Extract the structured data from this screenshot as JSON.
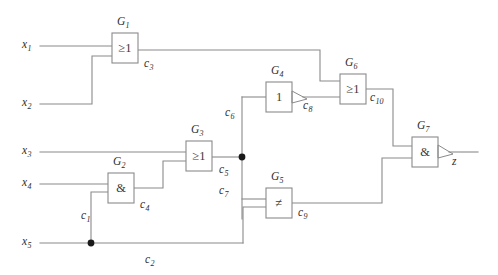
{
  "diagram": {
    "type": "combinational-logic-gate-network",
    "style": "IEC rectangular gate symbols",
    "output_signal": "z"
  },
  "inputs": [
    {
      "id": "x1",
      "label": "x",
      "index": "1"
    },
    {
      "id": "x2",
      "label": "x",
      "index": "2"
    },
    {
      "id": "x3",
      "label": "x",
      "index": "3"
    },
    {
      "id": "x4",
      "label": "x",
      "index": "4"
    },
    {
      "id": "x5",
      "label": "x",
      "index": "5"
    }
  ],
  "output": {
    "id": "z",
    "label": "z"
  },
  "gates": [
    {
      "id": "G1",
      "name": "G",
      "index": "1",
      "symbol": "≥1",
      "kind": "or",
      "inverted": false
    },
    {
      "id": "G2",
      "name": "G",
      "index": "2",
      "symbol": "&",
      "kind": "and",
      "inverted": false
    },
    {
      "id": "G3",
      "name": "G",
      "index": "3",
      "symbol": "≥1",
      "kind": "or",
      "inverted": false
    },
    {
      "id": "G4",
      "name": "G",
      "index": "4",
      "symbol": "1",
      "kind": "buffer",
      "inverted": true
    },
    {
      "id": "G5",
      "name": "G",
      "index": "5",
      "symbol": "≠",
      "kind": "xor",
      "inverted": false
    },
    {
      "id": "G6",
      "name": "G",
      "index": "6",
      "symbol": "≥1",
      "kind": "or",
      "inverted": false
    },
    {
      "id": "G7",
      "name": "G",
      "index": "7",
      "symbol": "&",
      "kind": "and",
      "inverted": true
    }
  ],
  "nets": [
    {
      "id": "c1",
      "label": "c",
      "index": "1"
    },
    {
      "id": "c2",
      "label": "c",
      "index": "2"
    },
    {
      "id": "c3",
      "label": "c",
      "index": "3"
    },
    {
      "id": "c4",
      "label": "c",
      "index": "4"
    },
    {
      "id": "c5",
      "label": "c",
      "index": "5"
    },
    {
      "id": "c6",
      "label": "c",
      "index": "6"
    },
    {
      "id": "c7",
      "label": "c",
      "index": "7"
    },
    {
      "id": "c8",
      "label": "c",
      "index": "8"
    },
    {
      "id": "c9",
      "label": "c",
      "index": "9"
    },
    {
      "id": "c10",
      "label": "c",
      "index": "10"
    }
  ],
  "connections": [
    {
      "from": "x1",
      "to": "G1.in1",
      "net": ""
    },
    {
      "from": "x2",
      "to": "G1.in2",
      "net": ""
    },
    {
      "from": "G1.out",
      "to": "G6.in1",
      "net": "c3"
    },
    {
      "from": "x5",
      "to": "G2.in2",
      "net": "c1"
    },
    {
      "from": "x4",
      "to": "G2.in1",
      "net": ""
    },
    {
      "from": "G2.out",
      "to": "G3.in2",
      "net": "c4"
    },
    {
      "from": "x3",
      "to": "G3.in1",
      "net": ""
    },
    {
      "from": "G3.out",
      "to": "junction",
      "net": "c5"
    },
    {
      "from": "junction",
      "to": "G4.in1",
      "net": "c6"
    },
    {
      "from": "junction",
      "to": "G5.in1",
      "net": "c7"
    },
    {
      "from": "G4.out",
      "to": "G6.in2",
      "net": "c8"
    },
    {
      "from": "x5",
      "to": "G5.in2",
      "net": "c2"
    },
    {
      "from": "G5.out",
      "to": "G7.in2",
      "net": "c9"
    },
    {
      "from": "G6.out",
      "to": "G7.in1",
      "net": "c10"
    },
    {
      "from": "G7.out",
      "to": "z",
      "net": ""
    }
  ],
  "colors": {
    "wire": "#8a8a8a",
    "gate_outline": "#8a8a8a",
    "gate_fill": "#ffffff",
    "text": "#2e2e2e",
    "junction_dot": "#1a1a1a",
    "background": "#ffffff"
  }
}
